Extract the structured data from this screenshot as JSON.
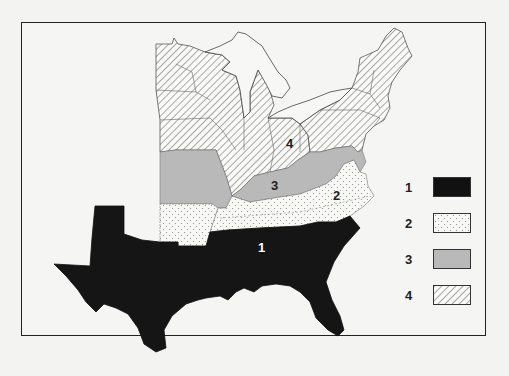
{
  "map": {
    "type": "choropleth",
    "region": "Eastern United States",
    "categories": [
      {
        "id": "1",
        "pattern": "solid-black",
        "color": "#111111",
        "states": [
          "Texas",
          "Louisiana",
          "Mississippi",
          "Alabama",
          "Georgia",
          "South Carolina",
          "Florida"
        ]
      },
      {
        "id": "2",
        "pattern": "dotted",
        "color": "#f8f8f4",
        "states": [
          "Arkansas",
          "Tennessee",
          "North Carolina"
        ]
      },
      {
        "id": "3",
        "pattern": "solid-gray",
        "color": "#b9b9b9",
        "states": [
          "Missouri",
          "Kentucky",
          "West Virginia",
          "Virginia",
          "Maryland",
          "Delaware"
        ]
      },
      {
        "id": "4",
        "pattern": "diagonal-hatch",
        "color": "#ffffff",
        "states": [
          "Minnesota",
          "Iowa",
          "Wisconsin",
          "Illinois",
          "Michigan",
          "Indiana",
          "Ohio",
          "Pennsylvania",
          "New York",
          "New Jersey",
          "Connecticut",
          "Rhode Island",
          "Massachusetts",
          "Vermont",
          "New Hampshire",
          "Maine"
        ]
      }
    ],
    "region_labels": [
      {
        "text": "1",
        "x": 262,
        "y": 248,
        "color": "#ffffff"
      },
      {
        "text": "2",
        "x": 337,
        "y": 195,
        "color": "#222222"
      },
      {
        "text": "3",
        "x": 275,
        "y": 185,
        "color": "#222222"
      },
      {
        "text": "4",
        "x": 290,
        "y": 143,
        "color": "#222222"
      }
    ]
  },
  "legend": {
    "items": [
      {
        "label": "1",
        "swatch": "solid-black"
      },
      {
        "label": "2",
        "swatch": "dotted"
      },
      {
        "label": "3",
        "swatch": "solid-gray"
      },
      {
        "label": "4",
        "swatch": "diagonal-hatch"
      }
    ]
  }
}
